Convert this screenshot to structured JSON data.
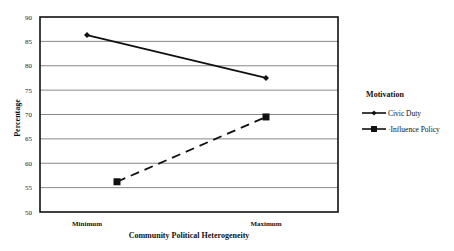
{
  "chart_data": {
    "type": "line",
    "title": "",
    "xlabel": "Community Political Heterogeneity",
    "ylabel": "Percentage",
    "categories": [
      "Minimum",
      "Maximum"
    ],
    "series": [
      {
        "name": "Civic Duty",
        "values": [
          86.3,
          77.5
        ],
        "marker": "diamond",
        "line": "solid"
      },
      {
        "name": "Influence Policy",
        "values": [
          56.2,
          69.5
        ],
        "marker": "square",
        "line": "dashed"
      }
    ],
    "ylim": [
      50,
      90
    ],
    "yticks": [
      50,
      55,
      60,
      65,
      70,
      75,
      80,
      85,
      90
    ],
    "grid": true,
    "legend": {
      "title": "Motivation",
      "position": "right"
    }
  },
  "colors": {
    "line": "#111111",
    "grid": "#555555",
    "background": "#ffffff"
  }
}
